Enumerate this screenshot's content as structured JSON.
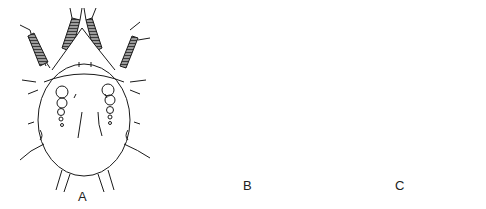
{
  "figure": {
    "panels": [
      {
        "id": "A",
        "label": "A",
        "description": "Mite, dorsal view, line drawing with oval body"
      },
      {
        "id": "B",
        "label": "B",
        "description": "Mite with dark shaded body, light central plate and long trailing setae"
      },
      {
        "id": "C",
        "label": "C",
        "description": "Round mite with heavily striated, dark stippled body"
      }
    ]
  },
  "colors": {
    "ink": "#1a1a1a",
    "shade": "#555555",
    "light": "#e8e8e8",
    "background": "#ffffff"
  }
}
